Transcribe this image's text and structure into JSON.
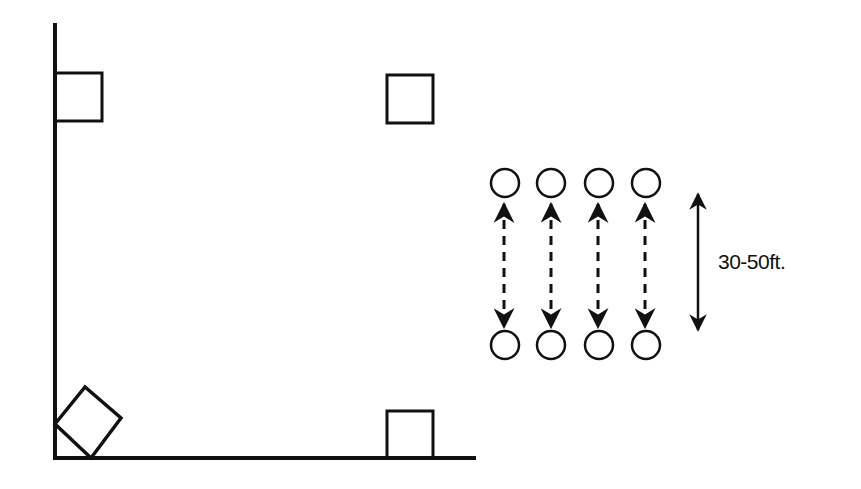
{
  "diagram": {
    "type": "field-layout",
    "colors": {
      "stroke": "#111111",
      "background": "#ffffff"
    },
    "field": {
      "left_boundary": {
        "x": 55,
        "y1": 23,
        "y2": 458
      },
      "bottom_boundary": {
        "y": 458,
        "x1": 55,
        "x2": 476
      },
      "cones": [
        {
          "name": "top-left-cone",
          "x": 55,
          "y": 73,
          "w": 47,
          "h": 48,
          "rotation": 0
        },
        {
          "name": "top-right-cone",
          "x": 387,
          "y": 74,
          "w": 47,
          "h": 49,
          "rotation": 0
        },
        {
          "name": "bottom-right-cone",
          "x": 386,
          "y": 411,
          "w": 47,
          "h": 47,
          "rotation": 0
        },
        {
          "name": "bottom-left-cone-rotated",
          "points": "55,424 85,387 121,418 91,458"
        }
      ]
    },
    "players": {
      "top_row": [
        {
          "cx": 505,
          "cy": 183
        },
        {
          "cx": 551,
          "cy": 183
        },
        {
          "cx": 599,
          "cy": 183
        },
        {
          "cx": 646,
          "cy": 183
        }
      ],
      "bottom_row": [
        {
          "cx": 505,
          "cy": 345
        },
        {
          "cx": 551,
          "cy": 345
        },
        {
          "cx": 599,
          "cy": 345
        },
        {
          "cx": 646,
          "cy": 345
        }
      ],
      "radius": 14
    },
    "passing_arrows": {
      "style": "dashed-double-headed",
      "y_top": 203,
      "y_bottom": 327,
      "count": 4
    },
    "distance_indicator": {
      "x": 698,
      "y_top": 193,
      "y_bottom": 330,
      "label": "30-50ft."
    }
  }
}
